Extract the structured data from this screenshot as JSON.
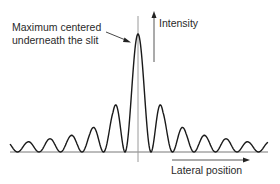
{
  "diagram": {
    "annotation": {
      "line1": "Maximum centered",
      "line2": "underneath the slit"
    },
    "y_axis_label": "Intensity",
    "x_axis_label": "Lateral position",
    "colors": {
      "curve": "#1a1a1a",
      "center_line": "#9a9a9a",
      "axis": "#444444",
      "text": "#2a2a2a"
    },
    "center_peak": {
      "x": 138,
      "y": 34
    },
    "baseline_y": 152,
    "side_peaks_left": [
      {
        "x": 113,
        "y": 111
      },
      {
        "x": 90,
        "y": 130
      },
      {
        "x": 69,
        "y": 136
      },
      {
        "x": 48,
        "y": 139
      },
      {
        "x": 27,
        "y": 142
      }
    ],
    "side_peaks_right": [
      {
        "x": 163,
        "y": 111
      },
      {
        "x": 186,
        "y": 130
      },
      {
        "x": 207,
        "y": 136
      },
      {
        "x": 228,
        "y": 139
      },
      {
        "x": 249,
        "y": 142
      }
    ]
  }
}
